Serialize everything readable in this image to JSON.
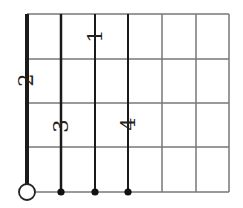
{
  "diagram": {
    "type": "string-fingering-grid",
    "grid": {
      "columns_x": [
        27,
        61,
        95,
        128,
        162,
        196,
        229
      ],
      "rows_y": [
        14,
        59,
        103,
        147,
        192
      ],
      "grid_color": "#777777",
      "string_color": "#1a1a1a"
    },
    "strings": [
      {
        "x": 27,
        "width": 4,
        "active": true
      },
      {
        "x": 61,
        "width": 2.5,
        "active": true
      },
      {
        "x": 95,
        "width": 2,
        "active": true
      },
      {
        "x": 128,
        "width": 2,
        "active": true
      }
    ],
    "open_marker": {
      "x": 27,
      "y": 192,
      "r": 8
    },
    "dots": [
      {
        "x": 61,
        "y": 192
      },
      {
        "x": 95,
        "y": 192
      },
      {
        "x": 128,
        "y": 192
      }
    ],
    "finger_labels": [
      {
        "text": "1",
        "x": 95,
        "y": 36
      },
      {
        "text": "2",
        "x": 26,
        "y": 80
      },
      {
        "text": "3",
        "x": 61,
        "y": 126
      },
      {
        "text": "4",
        "x": 128,
        "y": 124
      }
    ]
  }
}
